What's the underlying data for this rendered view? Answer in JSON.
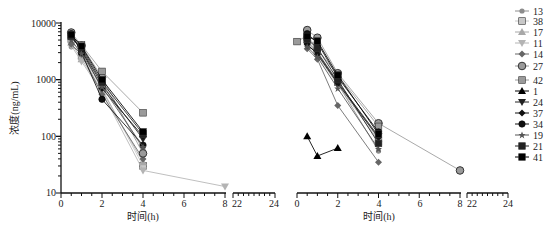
{
  "chart_data": [
    {
      "type": "line",
      "panel": "left",
      "title": "",
      "xlabel": "时间(h)",
      "ylabel": "浓度(ng/mL)",
      "yscale": "log",
      "ylim": [
        10,
        10000
      ],
      "yticks": [
        "10",
        "100",
        "1000",
        "10000"
      ],
      "xlim_segments": [
        [
          0,
          8
        ],
        [
          22,
          24
        ]
      ],
      "xticks": [
        "0",
        "2",
        "4",
        "6",
        "8",
        "22",
        "24"
      ],
      "grid": false,
      "series": [
        {
          "name": "13",
          "marker": "circle-small",
          "color": "#8c8c8c",
          "x": [
            0.5,
            1,
            2,
            4
          ],
          "y": [
            3800,
            3100,
            900,
            60
          ]
        },
        {
          "name": "38",
          "marker": "square",
          "color": "#c8c8c8",
          "x": [
            0.5,
            1,
            2,
            4
          ],
          "y": [
            5200,
            2600,
            700,
            30
          ]
        },
        {
          "name": "17",
          "marker": "triangle-up",
          "color": "#a8a8a8",
          "x": [
            0.5,
            1,
            2,
            4
          ],
          "y": [
            4500,
            2300,
            650,
            35
          ]
        },
        {
          "name": "11",
          "marker": "triangle-down",
          "color": "#b4b4b4",
          "x": [
            0.5,
            1,
            2,
            4,
            8
          ],
          "y": [
            4000,
            2100,
            600,
            25,
            13
          ]
        },
        {
          "name": "14",
          "marker": "diamond",
          "color": "#666666",
          "x": [
            0.5,
            1,
            2,
            4
          ],
          "y": [
            4200,
            2800,
            550,
            40
          ]
        },
        {
          "name": "27",
          "marker": "circle-large",
          "color": "#9a9a9a",
          "x": [
            0.5,
            1,
            2,
            4
          ],
          "y": [
            6800,
            4000,
            1100,
            50
          ]
        },
        {
          "name": "42",
          "marker": "square",
          "color": "#9a9a9a",
          "x": [
            0.5,
            1,
            2,
            4
          ],
          "y": [
            6000,
            4100,
            1400,
            260
          ]
        },
        {
          "name": "24",
          "marker": "triangle-down",
          "color": "#222222",
          "x": [
            0.5,
            1,
            2,
            4
          ],
          "y": [
            5500,
            3500,
            800,
            90
          ]
        },
        {
          "name": "37",
          "marker": "diamond",
          "color": "#111111",
          "x": [
            0.5,
            1,
            2,
            4
          ],
          "y": [
            6000,
            3300,
            700,
            100
          ]
        },
        {
          "name": "34",
          "marker": "circle",
          "color": "#111111",
          "x": [
            0.5,
            1,
            2,
            4
          ],
          "y": [
            6500,
            3000,
            450,
            70
          ]
        },
        {
          "name": "19",
          "marker": "star",
          "color": "#555555",
          "x": [
            0.5,
            1,
            2,
            4
          ],
          "y": [
            5000,
            2900,
            750,
            65
          ]
        },
        {
          "name": "21",
          "marker": "square",
          "color": "#222222",
          "x": [
            0.5,
            1,
            2,
            4
          ],
          "y": [
            5800,
            3700,
            900,
            110
          ]
        },
        {
          "name": "41",
          "marker": "square",
          "color": "#000000",
          "x": [
            0.5,
            1,
            2,
            4
          ],
          "y": [
            6200,
            3900,
            1000,
            120
          ]
        }
      ]
    },
    {
      "type": "line",
      "panel": "right",
      "title": "",
      "xlabel": "时间(h)",
      "ylabel": "",
      "yscale": "log",
      "ylim": [
        10,
        10000
      ],
      "xlim_segments": [
        [
          0,
          8
        ],
        [
          22,
          24
        ]
      ],
      "xticks": [
        "0",
        "2",
        "4",
        "6",
        "8",
        "22",
        "24"
      ],
      "grid": false,
      "series": [
        {
          "name": "13",
          "marker": "circle-small",
          "color": "#8c8c8c",
          "x": [
            0.5,
            1,
            2,
            4
          ],
          "y": [
            4500,
            3000,
            850,
            55
          ]
        },
        {
          "name": "38",
          "marker": "square",
          "color": "#c8c8c8",
          "x": [
            0.5,
            1,
            2,
            4
          ],
          "y": [
            5500,
            3200,
            900,
            80
          ]
        },
        {
          "name": "17",
          "marker": "triangle-up",
          "color": "#a8a8a8",
          "x": [
            0.5,
            1,
            2,
            4
          ],
          "y": [
            5000,
            3000,
            950,
            90
          ]
        },
        {
          "name": "11",
          "marker": "triangle-down",
          "color": "#b4b4b4",
          "x": [
            0.5,
            1,
            2,
            4
          ],
          "y": [
            4800,
            2700,
            800,
            85
          ]
        },
        {
          "name": "14",
          "marker": "diamond",
          "color": "#666666",
          "x": [
            0.5,
            1,
            2,
            4
          ],
          "y": [
            3500,
            2300,
            350,
            35
          ]
        },
        {
          "name": "27",
          "marker": "circle-large",
          "color": "#9a9a9a",
          "x": [
            0.5,
            1,
            2,
            4,
            8
          ],
          "y": [
            7500,
            5500,
            1300,
            170,
            25
          ]
        },
        {
          "name": "42",
          "marker": "square",
          "color": "#9a9a9a",
          "x": [
            0,
            0.5,
            1,
            2,
            4
          ],
          "y": [
            4700,
            6000,
            3500,
            1200,
            150
          ]
        },
        {
          "name": "1",
          "marker": "triangle-up",
          "color": "#000000",
          "x": [
            0.5,
            1,
            2
          ],
          "y": [
            100,
            45,
            62
          ]
        },
        {
          "name": "24",
          "marker": "triangle-down",
          "color": "#222222",
          "x": [
            0.5,
            1,
            2,
            4
          ],
          "y": [
            4000,
            3000,
            900,
            100
          ]
        },
        {
          "name": "37",
          "marker": "diamond",
          "color": "#111111",
          "x": [
            0.5,
            1,
            2,
            4
          ],
          "y": [
            4200,
            2800,
            850,
            95
          ]
        },
        {
          "name": "34",
          "marker": "circle",
          "color": "#111111",
          "x": [
            0.5,
            1,
            2,
            4
          ],
          "y": [
            6500,
            4500,
            1100,
            120
          ]
        },
        {
          "name": "19",
          "marker": "star",
          "color": "#555555",
          "x": [
            0.5,
            1,
            2,
            4
          ],
          "y": [
            3800,
            2500,
            700,
            60
          ]
        },
        {
          "name": "21",
          "marker": "square",
          "color": "#222222",
          "x": [
            0.5,
            1,
            2,
            4
          ],
          "y": [
            5200,
            3600,
            1000,
            75
          ]
        },
        {
          "name": "41",
          "marker": "square",
          "color": "#000000",
          "x": [
            0.5,
            1,
            2,
            4
          ],
          "y": [
            5800,
            4800,
            1200,
            110
          ]
        }
      ]
    }
  ],
  "legend": {
    "position": "right",
    "items": [
      {
        "label": "13",
        "marker": "circle-small",
        "color": "#8c8c8c"
      },
      {
        "label": "38",
        "marker": "square",
        "color": "#c8c8c8"
      },
      {
        "label": "17",
        "marker": "triangle-up",
        "color": "#a8a8a8"
      },
      {
        "label": "11",
        "marker": "triangle-down",
        "color": "#b4b4b4"
      },
      {
        "label": "14",
        "marker": "diamond",
        "color": "#666666"
      },
      {
        "label": "27",
        "marker": "circle-large",
        "color": "#9a9a9a"
      },
      {
        "label": "42",
        "marker": "square",
        "color": "#9a9a9a"
      },
      {
        "label": "1",
        "marker": "triangle-up",
        "color": "#000000"
      },
      {
        "label": "24",
        "marker": "triangle-down",
        "color": "#222222"
      },
      {
        "label": "37",
        "marker": "diamond",
        "color": "#111111"
      },
      {
        "label": "34",
        "marker": "circle",
        "color": "#111111"
      },
      {
        "label": "19",
        "marker": "star",
        "color": "#555555"
      },
      {
        "label": "21",
        "marker": "square",
        "color": "#222222"
      },
      {
        "label": "41",
        "marker": "square",
        "color": "#000000"
      }
    ]
  }
}
